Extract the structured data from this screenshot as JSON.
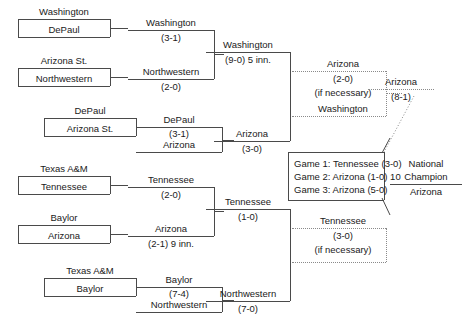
{
  "bracket": {
    "title": "",
    "round1": [
      {
        "top": "Washington",
        "bottom": "DePaul"
      },
      {
        "top": "Arizona St.",
        "bottom": "Northwestern"
      },
      {
        "top": "DePaul",
        "bottom": "Arizona St."
      },
      {
        "top": "Texas A&M",
        "bottom": "Tennessee"
      },
      {
        "top": "Baylor",
        "bottom": "Arizona"
      },
      {
        "top": "Texas A&M",
        "bottom": "Baylor"
      }
    ],
    "round2": [
      {
        "winner": "Washington",
        "score": "(3-1)",
        "loser": ""
      },
      {
        "winner": "Northwestern",
        "score": "(2-0)",
        "loser": ""
      },
      {
        "winner": "DePaul",
        "score": "(3-1)",
        "loser": "Arizona"
      },
      {
        "winner": "Tennessee",
        "score": "(2-0)",
        "loser": ""
      },
      {
        "winner": "Arizona",
        "score": "(2-1) 9 inn.",
        "loser": ""
      },
      {
        "winner": "Baylor",
        "score": "(7-4)",
        "loser": "Northwestern"
      }
    ],
    "round3": [
      {
        "winner": "Washington",
        "score": "(9-0) 5 inn."
      },
      {
        "winner": "Arizona",
        "score": "(3-0)"
      },
      {
        "winner": "Tennessee",
        "score": "(1-0)"
      },
      {
        "winner": "Northwestern",
        "score": "(7-0)"
      }
    ],
    "if_necessary": [
      {
        "winner": "Arizona",
        "score": "(2-0)",
        "note": "(if necessary)",
        "loser": "Washington"
      },
      {
        "winner": "Tennessee",
        "score": "(3-0)",
        "note": "(if necessary)",
        "loser": ""
      }
    ],
    "final_bracket": {
      "winner": "Arizona",
      "score": "(8-1)"
    },
    "championship_series": {
      "games": [
        "Game 1: Tennessee (3-0)",
        "Game 2: Arizona (1-0) 10",
        "Game 3: Arizona (5-0)"
      ]
    },
    "champion": {
      "label_line1": "National",
      "label_line2": "Champion",
      "team": "Arizona"
    }
  }
}
